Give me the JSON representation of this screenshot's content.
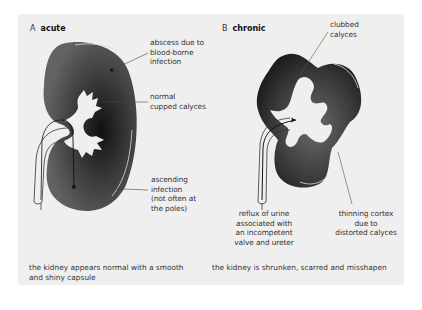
{
  "panel_a": {
    "letter": "A",
    "title": "acute",
    "labels": {
      "abscess": [
        "abscess due to",
        "blood-borne",
        "infection"
      ],
      "calyces": [
        "normal",
        "cupped calyces"
      ],
      "ascending": [
        "ascending",
        "infection",
        "(not often at",
        "the poles)"
      ]
    },
    "caption": [
      "the kidney appears normal with a smooth",
      "and shiny capsule"
    ]
  },
  "panel_b": {
    "letter": "B",
    "title": "chronic",
    "labels": {
      "clubbed": [
        "clubbed",
        "calyces"
      ],
      "reflux": [
        "reflux of urine",
        "associated with",
        "an incompetent",
        "valve and ureter"
      ],
      "thinning": [
        "thinning cortex",
        "due to",
        "distorted calyces"
      ]
    },
    "caption": [
      "the kidney is shrunken, scarred and misshapen"
    ]
  },
  "colors": {
    "background": "#efefef",
    "kidney_dark": "#1e1e1e",
    "kidney_mid": "#5a5a5a",
    "leader_line": "#555555"
  }
}
